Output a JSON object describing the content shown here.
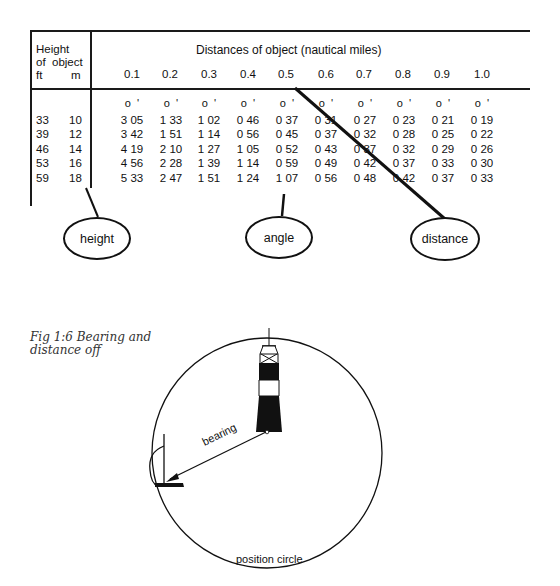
{
  "table": {
    "title": "Distances of object (nautical miles)",
    "height_header": [
      "Height",
      "of  object"
    ],
    "unit_ft": "ft",
    "unit_m": "m",
    "distance_columns": [
      "0.1",
      "0.2",
      "0.3",
      "0.4",
      "0.5",
      "0.6",
      "0.7",
      "0.8",
      "0.9",
      "1.0"
    ],
    "degree_minute_marker": "o  '",
    "rows": [
      {
        "ft": "33",
        "m": "10",
        "values": [
          "3 05",
          "1 33",
          "1 02",
          "0 46",
          "0 37",
          "0 31",
          "0 27",
          "0 23",
          "0 21",
          "0 19"
        ]
      },
      {
        "ft": "39",
        "m": "12",
        "values": [
          "3 42",
          "1 51",
          "1 14",
          "0 56",
          "0 45",
          "0 37",
          "0 32",
          "0 28",
          "0 25",
          "0 22"
        ]
      },
      {
        "ft": "46",
        "m": "14",
        "values": [
          "4 19",
          "2 10",
          "1 27",
          "1 05",
          "0 52",
          "0 43",
          "0 37",
          "0 32",
          "0 29",
          "0 26"
        ]
      },
      {
        "ft": "53",
        "m": "16",
        "values": [
          "4 56",
          "2 28",
          "1 39",
          "1 14",
          "0 59",
          "0 49",
          "0 42",
          "0 37",
          "0 33",
          "0 30"
        ]
      },
      {
        "ft": "59",
        "m": "18",
        "values": [
          "5 33",
          "2 47",
          "1 51",
          "1 24",
          "1 07",
          "0 56",
          "0 48",
          "0 42",
          "0 37",
          "0 33"
        ]
      }
    ]
  },
  "callouts": {
    "height": "height",
    "angle": "angle",
    "distance": "distance"
  },
  "figure": {
    "caption_line1": "Fig 1:6 Bearing and",
    "caption_line2": "distance off",
    "bearing_label": "bearing",
    "circle_label": "position circle",
    "icons": [
      "lighthouse-icon",
      "ship-mast-icon",
      "arrow-icon"
    ]
  }
}
